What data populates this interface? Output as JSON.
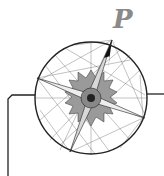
{
  "figure": {
    "label": "P",
    "label_color": "#8a8a8a",
    "stroke_color": "#222222"
  }
}
